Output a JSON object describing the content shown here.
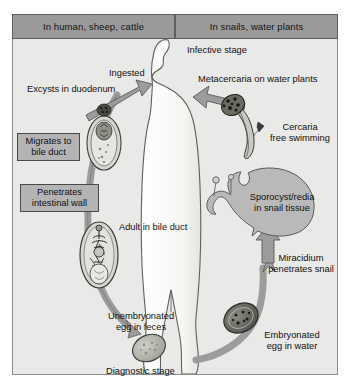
{
  "diagram": {
    "frame": {
      "background": "#e9e9e7",
      "border": "#8d8d8d"
    },
    "headers": [
      {
        "id": "host-human",
        "label": "In human, sheep, cattle"
      },
      {
        "id": "host-snail",
        "label": "In snails, water plants"
      }
    ],
    "header_style": {
      "fill": "#9a9a9a",
      "border": "#5e5e5e",
      "text": "#141414"
    },
    "boxed_labels": [
      {
        "id": "migrates-bile-duct",
        "line1": "Migrates to",
        "line2": "bile duct"
      },
      {
        "id": "penetrates-intestinal-wall",
        "line1": "Penetrates",
        "line2": "intestinal wall"
      }
    ],
    "box_style": {
      "fill": "#b4b4b4",
      "border": "#4a4a4a"
    },
    "labels": [
      {
        "id": "ingested",
        "text": "Ingested"
      },
      {
        "id": "excysts-in-duodenum",
        "text": "Excysts in duodenum"
      },
      {
        "id": "adult-in-bile-duct",
        "text": "Adult in bile duct"
      },
      {
        "id": "unembryonated-egg-line1",
        "text": "Unembryonated"
      },
      {
        "id": "unembryonated-egg-line2",
        "text": "egg in feces"
      },
      {
        "id": "diagnostic-stage",
        "text": "Diagnostic stage"
      },
      {
        "id": "infective-stage",
        "text": "Infective stage"
      },
      {
        "id": "metacercaria-on-water-plants",
        "text": "Metacercaria on water plants"
      },
      {
        "id": "cercaria-line1",
        "text": "Cercaria"
      },
      {
        "id": "cercaria-line2",
        "text": "free swimming"
      },
      {
        "id": "sporocyst-line1",
        "text": "Sporocyst/redia"
      },
      {
        "id": "sporocyst-line2",
        "text": "in snail tissue"
      },
      {
        "id": "miracidium-line1",
        "text": "Miracidium"
      },
      {
        "id": "miracidium-line2",
        "text": "penetrates snail"
      },
      {
        "id": "embryonated-egg-line1",
        "text": "Embryonated"
      },
      {
        "id": "embryonated-egg-line2",
        "text": "egg in water"
      }
    ],
    "colors": {
      "arrow_fill": "#9c9c9c",
      "arrow_stroke": "#5a5a5a",
      "silhouette_fill": "#f7f7f5",
      "silhouette_stroke": "#5f5f5f",
      "snail_fill": "#b9b9b9",
      "snail_stroke": "#5a5a5a",
      "organism_fill": "#d2d2ce",
      "organism_stroke": "#3c3c3c",
      "egg_fill": "#b0b0aa",
      "text": "#111111"
    },
    "stages": [
      {
        "id": "metacercaria-cyst",
        "name": "metacercaria cyst in duodenum"
      },
      {
        "id": "adult-fluke",
        "name": "adult liver fluke"
      },
      {
        "id": "unembryonated-egg",
        "name": "unembryonated egg"
      },
      {
        "id": "embryonated-egg",
        "name": "embryonated egg"
      },
      {
        "id": "cercaria",
        "name": "free swimming cercaria"
      },
      {
        "id": "snail",
        "name": "snail host"
      }
    ]
  }
}
